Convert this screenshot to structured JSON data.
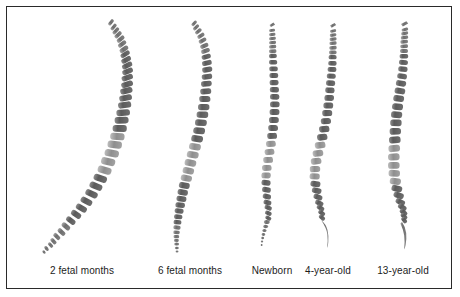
{
  "figure": {
    "background_color": "#ffffff",
    "frame_color": "#2a2a2a",
    "bone_dark": "#5e5e5e",
    "bone_mid": "#777777",
    "bone_light": "#9a9a9a",
    "disc_color": "#c9c9c9",
    "width": 460,
    "height": 297
  },
  "labels": [
    {
      "id": "stage-1",
      "text": "2 fetal months",
      "center_x": 82,
      "y": 271
    },
    {
      "id": "stage-2",
      "text": "6 fetal months",
      "center_x": 190,
      "y": 271
    },
    {
      "id": "stage-3",
      "text": "Newborn",
      "center_x": 272,
      "y": 271
    },
    {
      "id": "stage-4",
      "text": "4-year-old",
      "center_x": 328,
      "y": 271
    },
    {
      "id": "stage-5",
      "text": "13-year-old",
      "center_x": 403,
      "y": 271
    }
  ],
  "specimens": [
    {
      "id": "spine-2-fetal-months",
      "name": "2 fetal months",
      "curvature": "single C-shaped primary kyphotic curve",
      "top_x": 112,
      "top_y": 22,
      "bottom_x": 52,
      "bottom_y": 255,
      "vertebra_count": 33
    },
    {
      "id": "spine-6-fetal-months",
      "name": "6 fetal months",
      "curvature": "long gentle C-curve, slightly straightening",
      "top_x": 196,
      "top_y": 24,
      "bottom_x": 178,
      "bottom_y": 256,
      "vertebra_count": 33
    },
    {
      "id": "spine-newborn",
      "name": "Newborn",
      "curvature": "nearly vertical with faint thoracic kyphosis",
      "top_x": 272,
      "top_y": 26,
      "bottom_x": 262,
      "bottom_y": 254,
      "vertebra_count": 33
    },
    {
      "id": "spine-4-year-old",
      "name": "4-year-old",
      "curvature": "developing S-curve with emerging lumbar lordosis",
      "top_x": 333,
      "top_y": 26,
      "bottom_x": 327,
      "bottom_y": 254,
      "vertebra_count": 33
    },
    {
      "id": "spine-13-year-old",
      "name": "13-year-old",
      "curvature": "mature S-curve: cervical lordosis, thoracic kyphosis, lumbar lordosis",
      "top_x": 405,
      "top_y": 24,
      "bottom_x": 404,
      "bottom_y": 254,
      "vertebra_count": 33
    }
  ]
}
